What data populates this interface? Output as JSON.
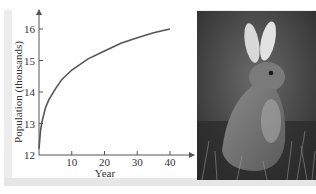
{
  "chart_data": {
    "type": "line",
    "title": "",
    "xlabel": "Year",
    "ylabel": "Population (thousands)",
    "xlim": [
      0,
      45
    ],
    "ylim": [
      12,
      16.5
    ],
    "x_ticks": [
      10,
      20,
      30,
      40
    ],
    "y_ticks": [
      12,
      13,
      14,
      15,
      16
    ],
    "grid": false,
    "legend": null,
    "series": [
      {
        "name": "Population",
        "x": [
          0,
          0.5,
          1,
          2,
          3,
          5,
          7,
          10,
          15,
          20,
          25,
          30,
          35,
          40
        ],
        "y": [
          12.2,
          12.8,
          13.1,
          13.5,
          13.75,
          14.1,
          14.4,
          14.7,
          15.05,
          15.3,
          15.55,
          15.72,
          15.88,
          16.0
        ]
      }
    ]
  },
  "labels": {
    "xlabel": "Year",
    "ylabel": "Population (thousands)",
    "x_tick_labels": [
      "10",
      "20",
      "30",
      "40"
    ],
    "y_tick_labels": [
      "12",
      "13",
      "14",
      "15",
      "16"
    ]
  },
  "photo": {
    "subject": "rabbit-photo"
  },
  "colors": {
    "curve": "#555555",
    "axis": "#555555",
    "frame": "#ececec"
  }
}
